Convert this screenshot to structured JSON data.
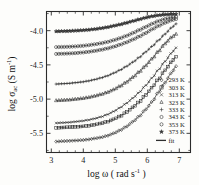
{
  "chart_data": {
    "type": "line",
    "title": "",
    "xlabel": "log ω ( rad s⁻¹ )",
    "ylabel": "log σac (S m⁻¹)",
    "xlabel_parts": {
      "prefix": "log ω ( rad s",
      "sup": "-1",
      "suffix": " )"
    },
    "ylabel_parts": {
      "prefix": "log σ",
      "sub": "ac",
      "mid": " (S m",
      "sup": "-1",
      "suffix": ")"
    },
    "xlim": [
      2.85,
      7.35
    ],
    "ylim": [
      -5.78,
      -3.72
    ],
    "xticks": [
      3,
      4,
      5,
      6,
      7
    ],
    "xtick_labels": [
      "3",
      "4",
      "5",
      "6",
      "7"
    ],
    "yticks": [
      -4.0,
      -4.5,
      -5.0,
      -5.5
    ],
    "ytick_labels": [
      "-4.0",
      "-4.5",
      "-5.0",
      "-5.5"
    ],
    "grid": false,
    "legend_position": "right-middle",
    "legend_title": "",
    "series": [
      {
        "name": "293 K",
        "label": "293 K",
        "marker": "diamond",
        "x": [
          3.15,
          3.35,
          3.55,
          3.75,
          3.95,
          4.15,
          4.35,
          4.55,
          4.75,
          4.95,
          5.15,
          5.35,
          5.55,
          5.75,
          5.95,
          6.15,
          6.35,
          6.55,
          6.75,
          6.9
        ],
        "y": [
          -5.62,
          -5.615,
          -5.61,
          -5.605,
          -5.6,
          -5.59,
          -5.575,
          -5.56,
          -5.535,
          -5.5,
          -5.455,
          -5.4,
          -5.33,
          -5.25,
          -5.15,
          -5.04,
          -4.9,
          -4.76,
          -4.62,
          -4.52
        ]
      },
      {
        "name": "303 K",
        "label": "303 K",
        "marker": "square",
        "x": [
          3.15,
          3.35,
          3.55,
          3.75,
          3.95,
          4.15,
          4.35,
          4.55,
          4.75,
          4.95,
          5.15,
          5.35,
          5.55,
          5.75,
          5.95,
          6.15,
          6.35,
          6.55,
          6.75,
          6.9
        ],
        "y": [
          -5.42,
          -5.415,
          -5.41,
          -5.405,
          -5.4,
          -5.39,
          -5.375,
          -5.355,
          -5.33,
          -5.295,
          -5.25,
          -5.19,
          -5.12,
          -5.04,
          -4.94,
          -4.83,
          -4.71,
          -4.58,
          -4.46,
          -4.38
        ]
      },
      {
        "name": "313 K",
        "label": "313 K",
        "marker": "cross",
        "x": [
          3.15,
          3.35,
          3.55,
          3.75,
          3.95,
          4.15,
          4.35,
          4.55,
          4.75,
          4.95,
          5.15,
          5.35,
          5.55,
          5.75,
          5.95,
          6.15,
          6.35,
          6.55,
          6.75,
          6.9
        ],
        "y": [
          -5.35,
          -5.345,
          -5.34,
          -5.33,
          -5.32,
          -5.305,
          -5.285,
          -5.26,
          -5.225,
          -5.18,
          -5.125,
          -5.06,
          -4.985,
          -4.9,
          -4.8,
          -4.69,
          -4.57,
          -4.45,
          -4.33,
          -4.25
        ]
      },
      {
        "name": "323 K",
        "label": "323 K",
        "marker": "triangle",
        "x": [
          3.15,
          3.35,
          3.55,
          3.75,
          3.95,
          4.15,
          4.35,
          4.55,
          4.75,
          4.95,
          5.15,
          5.35,
          5.55,
          5.75,
          5.95,
          6.15,
          6.35,
          6.55,
          6.75,
          6.9
        ],
        "y": [
          -5.02,
          -5.015,
          -5.01,
          -5.0,
          -4.99,
          -4.975,
          -4.955,
          -4.93,
          -4.9,
          -4.86,
          -4.81,
          -4.75,
          -4.68,
          -4.6,
          -4.51,
          -4.41,
          -4.3,
          -4.19,
          -4.1,
          -4.05
        ]
      },
      {
        "name": "333 K",
        "label": "333 K",
        "marker": "plus",
        "x": [
          3.15,
          3.35,
          3.55,
          3.75,
          3.95,
          4.15,
          4.35,
          4.55,
          4.75,
          4.95,
          5.15,
          5.35,
          5.55,
          5.75,
          5.95,
          6.15,
          6.35,
          6.55,
          6.75,
          6.9
        ],
        "y": [
          -4.78,
          -4.775,
          -4.77,
          -4.76,
          -4.75,
          -4.735,
          -4.715,
          -4.69,
          -4.66,
          -4.62,
          -4.575,
          -4.52,
          -4.46,
          -4.39,
          -4.31,
          -4.23,
          -4.14,
          -4.05,
          -3.96,
          -3.9
        ]
      },
      {
        "name": "343 K",
        "label": "343 K",
        "marker": "circle",
        "x": [
          3.15,
          3.35,
          3.55,
          3.75,
          3.95,
          4.15,
          4.35,
          4.55,
          4.75,
          4.95,
          5.15,
          5.35,
          5.55,
          5.75,
          5.95,
          6.15,
          6.35,
          6.55,
          6.75,
          6.9
        ],
        "y": [
          -4.34,
          -4.337,
          -4.333,
          -4.328,
          -4.32,
          -4.31,
          -4.297,
          -4.28,
          -4.26,
          -4.235,
          -4.205,
          -4.17,
          -4.13,
          -4.085,
          -4.035,
          -3.98,
          -3.93,
          -3.885,
          -3.85,
          -3.83
        ]
      },
      {
        "name": "353 K",
        "label": "353 K",
        "marker": "hexagon",
        "x": [
          3.15,
          3.35,
          3.55,
          3.75,
          3.95,
          4.15,
          4.35,
          4.55,
          4.75,
          4.95,
          5.15,
          5.35,
          5.55,
          5.75,
          5.95,
          6.15,
          6.35,
          6.55,
          6.75,
          6.9
        ],
        "y": [
          -4.24,
          -4.238,
          -4.235,
          -4.23,
          -4.223,
          -4.213,
          -4.2,
          -4.185,
          -4.165,
          -4.14,
          -4.11,
          -4.075,
          -4.035,
          -3.99,
          -3.945,
          -3.9,
          -3.86,
          -3.83,
          -3.81,
          -3.8
        ]
      },
      {
        "name": "373 K",
        "label": "373 K",
        "marker": "star",
        "x": [
          3.15,
          3.35,
          3.55,
          3.75,
          3.95,
          4.15,
          4.35,
          4.55,
          4.75,
          4.95,
          5.15,
          5.35,
          5.55,
          5.75,
          5.95,
          6.15,
          6.35,
          6.55,
          6.75,
          6.9
        ],
        "y": [
          -4.01,
          -4.008,
          -4.005,
          -4.0,
          -3.995,
          -3.988,
          -3.978,
          -3.965,
          -3.95,
          -3.93,
          -3.91,
          -3.885,
          -3.86,
          -3.835,
          -3.81,
          -3.79,
          -3.775,
          -3.765,
          -3.76,
          -3.758
        ]
      }
    ],
    "fit_label": "fit"
  },
  "legend": {
    "items": [
      {
        "label": "293 K",
        "marker": "diamond"
      },
      {
        "label": "303 K",
        "marker": "square"
      },
      {
        "label": "313 K",
        "marker": "cross"
      },
      {
        "label": "323 K",
        "marker": "triangle"
      },
      {
        "label": "333 K",
        "marker": "plus"
      },
      {
        "label": "343 K",
        "marker": "circle"
      },
      {
        "label": "353 K",
        "marker": "hexagon"
      },
      {
        "label": "373 K",
        "marker": "star"
      }
    ],
    "fit_label": "fit"
  }
}
